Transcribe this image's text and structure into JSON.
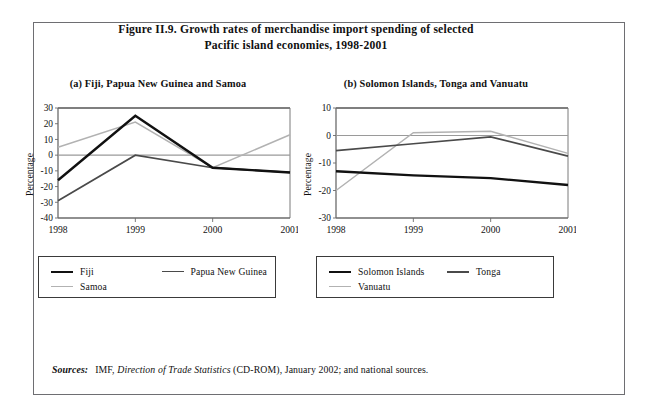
{
  "figure": {
    "title_line1": "Figure II.9.  Growth rates of merchandise import spending of selected",
    "title_line2": "Pacific island economies, 1998-2001",
    "sources_label": "Sources:",
    "sources_pre": "IMF,",
    "sources_italic": "Direction of Trade Statistics",
    "sources_post": "(CD-ROM), January 2002; and national sources."
  },
  "colors": {
    "series_dark": "#111111",
    "series_mid": "#4a4a4a",
    "series_light": "#b2b2b2",
    "axis": "#6b6b6b",
    "frame": "#6e6e72",
    "legend_border": "#3a3a3a"
  },
  "panel_a": {
    "caption": "(a)  Fiji, Papua New Guinea and Samoa",
    "ylabel": "Percentage",
    "legend": [
      {
        "label": "Fiji",
        "color": "#111111",
        "width": 2.6
      },
      {
        "label": "Papua New Guinea",
        "color": "#4a4a4a",
        "width": 1.7
      },
      {
        "label": "Samoa",
        "color": "#b2b2b2",
        "width": 1.7
      }
    ]
  },
  "panel_b": {
    "caption": "(b)  Solomon Islands, Tonga and Vanuatu",
    "ylabel": "Percentage",
    "legend": [
      {
        "label": "Solomon Islands",
        "color": "#111111",
        "width": 2.6
      },
      {
        "label": "Tonga",
        "color": "#4a4a4a",
        "width": 2.2
      },
      {
        "label": "Vanuatu",
        "color": "#b2b2b2",
        "width": 1.7
      }
    ]
  },
  "chart_data": [
    {
      "type": "line",
      "id": "panel-a",
      "title": "(a)  Fiji, Papua New Guinea and Samoa",
      "xlabel": "",
      "ylabel": "Percentage",
      "categories": [
        "1998",
        "1999",
        "2000",
        "2001"
      ],
      "x": [
        1998,
        1999,
        2000,
        2001
      ],
      "ylim": [
        -40,
        30
      ],
      "yticks": [
        30,
        20,
        10,
        0,
        -10,
        -20,
        -30,
        -40
      ],
      "grid": false,
      "zero_line": true,
      "legend_position": "bottom",
      "series": [
        {
          "name": "Fiji",
          "values": [
            -16,
            25,
            -8,
            -11
          ],
          "color": "#111111"
        },
        {
          "name": "Papua New Guinea",
          "values": [
            -29,
            0,
            -8,
            -11
          ],
          "color": "#4a4a4a"
        },
        {
          "name": "Samoa",
          "values": [
            5,
            21,
            -8,
            13
          ],
          "color": "#b2b2b2"
        }
      ]
    },
    {
      "type": "line",
      "id": "panel-b",
      "title": "(b)  Solomon Islands, Tonga and Vanuatu",
      "xlabel": "",
      "ylabel": "Percentage",
      "categories": [
        "1998",
        "1999",
        "2000",
        "2001"
      ],
      "x": [
        1998,
        1999,
        2000,
        2001
      ],
      "ylim": [
        -30,
        10
      ],
      "yticks": [
        10,
        0,
        -10,
        -20,
        -30
      ],
      "grid": false,
      "zero_line": true,
      "legend_position": "bottom",
      "series": [
        {
          "name": "Solomon Islands",
          "values": [
            -13,
            -14.5,
            -15.5,
            -18
          ],
          "color": "#111111"
        },
        {
          "name": "Tonga",
          "values": [
            -5.5,
            -3,
            -0.5,
            -7.5
          ],
          "color": "#4a4a4a"
        },
        {
          "name": "Vanuatu",
          "values": [
            -20,
            1,
            1.5,
            -6.5
          ],
          "color": "#b2b2b2"
        }
      ]
    }
  ]
}
